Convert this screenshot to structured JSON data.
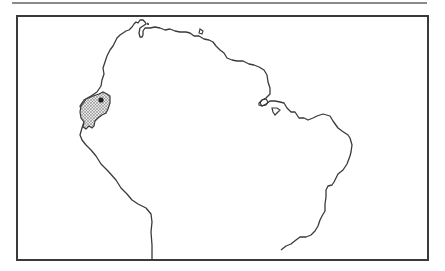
{
  "map": {
    "region": "Northern South America",
    "highlighted_area": "Ecuador",
    "highlight_pattern": "stippled",
    "marker": "dark dot (locality)",
    "colors": {
      "coastline": "#3a3a3a",
      "frame": "#3a3a3a",
      "top_rule": "#8a8a8a",
      "highlight_fill": "#bdbdbd",
      "marker": "#222222"
    }
  }
}
